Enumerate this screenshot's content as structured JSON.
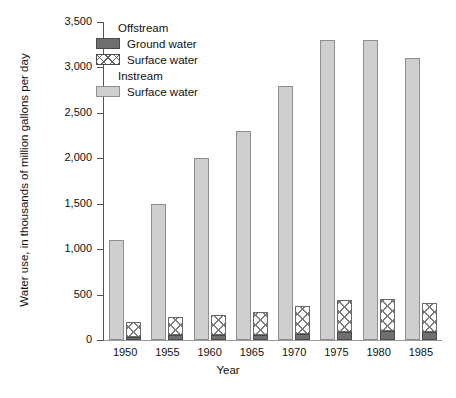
{
  "chart_data": {
    "type": "bar",
    "title": "",
    "xlabel": "Year",
    "ylabel": "Water use, in thousands of million gallons per day",
    "categories": [
      "1950",
      "1955",
      "1960",
      "1965",
      "1970",
      "1975",
      "1980",
      "1985"
    ],
    "ylim": [
      0,
      3500
    ],
    "yticks": [
      0,
      500,
      1000,
      1500,
      2000,
      2500,
      3000,
      3500
    ],
    "ytick_labels": [
      "0",
      "500",
      "1,000",
      "1,500",
      "2,000",
      "2,500",
      "3,000",
      "3,500"
    ],
    "grid": false,
    "legend_position": "upper-left-inside",
    "series": [
      {
        "name": "Instream Surface water",
        "group": "Instream",
        "stacked": false,
        "color": "#cfcfcf",
        "values": [
          1100,
          1500,
          2000,
          2300,
          2800,
          3300,
          3300,
          3100
        ]
      },
      {
        "name": "Offstream Ground water",
        "group": "Offstream",
        "stacked": true,
        "color": "#6f6f6f",
        "values": [
          35,
          50,
          55,
          60,
          70,
          85,
          95,
          90
        ]
      },
      {
        "name": "Offstream Surface water",
        "group": "Offstream",
        "stacked": true,
        "color": "#ffffff",
        "values": [
          165,
          200,
          215,
          250,
          300,
          355,
          360,
          320
        ]
      }
    ],
    "offstream_totals": [
      200,
      250,
      270,
      310,
      370,
      440,
      455,
      410
    ]
  },
  "legend": {
    "group_offstream": "Offstream",
    "group_instream": "Instream",
    "items": [
      {
        "label": "Ground water",
        "swatch": "solid-dark-gray",
        "group": "Offstream"
      },
      {
        "label": "Surface water",
        "swatch": "cross-hatch-white",
        "group": "Offstream"
      },
      {
        "label": "Surface water",
        "swatch": "solid-light-gray",
        "group": "Instream"
      }
    ]
  },
  "axes": {
    "y_title": "Water use, in thousands of million gallons per day",
    "x_title": "Year"
  },
  "colors": {
    "ground_water": "#6f6f6f",
    "offstream_surface": "#ffffff",
    "instream_surface": "#cfcfcf",
    "axis": "#555555"
  }
}
